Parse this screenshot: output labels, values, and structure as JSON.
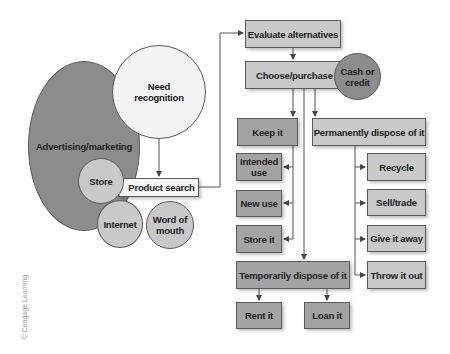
{
  "diagram": {
    "type": "consumer decision process flowchart",
    "nodes": {
      "need_recognition": "Need\nrecognition",
      "advertising": "Advertising/marketing",
      "store": "Store",
      "product_search": "Product search",
      "internet": "Internet",
      "word_of_mouth": "Word of\nmouth",
      "evaluate": "Evaluate alternatives",
      "choose": "Choose/purchase",
      "cash_credit": "Cash or\ncredit",
      "keep_it": "Keep it",
      "perm_dispose": "Permanently dispose of it",
      "intended_use": "Intended\nuse",
      "new_use": "New use",
      "store_it": "Store it",
      "recycle": "Recycle",
      "sell_trade": "Sell/trade",
      "give_away": "Give it away",
      "throw_out": "Throw it out",
      "temp_dispose": "Temporarily dispose of it",
      "rent_it": "Rent it",
      "loan_it": "Loan it"
    },
    "credit": "© Cengage Learning",
    "colors": {
      "light_box": "#c9c9c9",
      "mid_box": "#a3a3a3",
      "dark_circle": "#8c8c8c",
      "white_circle": "#f4f4f4",
      "line": "#555555"
    }
  }
}
